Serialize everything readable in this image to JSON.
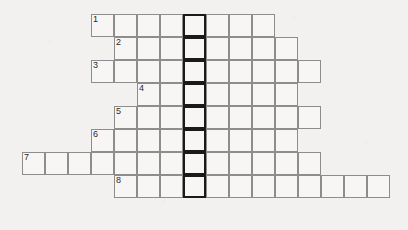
{
  "puzzle": {
    "kind": "crossword-grid",
    "title": "Crossword puzzle grid",
    "background_color": "#f2f1ef",
    "cell_fill_color": "#f7f6f4",
    "cell_border_color": "#8d8d8d",
    "highlight_border_color": "#1a1a1a",
    "number_text_color": "#2a2a2a",
    "cell_size_px": 23,
    "origin_x_px": 22,
    "origin_y_px": 14,
    "rows_count": 8,
    "columns_count": 16,
    "highlight_column_index": 7,
    "highlight_description": "bold outlined vertical column of 8 cells",
    "rows": [
      {
        "number": "1",
        "row_index": 0,
        "start_column": 3,
        "length": 8,
        "number_column": 3,
        "letters": [
          "",
          "",
          "",
          "",
          "",
          "",
          "",
          ""
        ]
      },
      {
        "number": "2",
        "row_index": 1,
        "start_column": 4,
        "length": 8,
        "number_column": 4,
        "letters": [
          "",
          "",
          "",
          "",
          "",
          "",
          "",
          ""
        ]
      },
      {
        "number": "3",
        "row_index": 2,
        "start_column": 3,
        "length": 10,
        "number_column": 3,
        "letters": [
          "",
          "",
          "",
          "",
          "",
          "",
          "",
          "",
          "",
          ""
        ]
      },
      {
        "number": "4",
        "row_index": 3,
        "start_column": 5,
        "length": 7,
        "number_column": 5,
        "letters": [
          "",
          "",
          "",
          "",
          "",
          "",
          ""
        ]
      },
      {
        "number": "5",
        "row_index": 4,
        "start_column": 4,
        "length": 9,
        "number_column": 4,
        "letters": [
          "",
          "",
          "",
          "",
          "",
          "",
          "",
          "",
          ""
        ]
      },
      {
        "number": "6",
        "row_index": 5,
        "start_column": 3,
        "length": 9,
        "number_column": 3,
        "letters": [
          "",
          "",
          "",
          "",
          "",
          "",
          "",
          "",
          ""
        ]
      },
      {
        "number": "7",
        "row_index": 6,
        "start_column": 0,
        "length": 13,
        "number_column": 0,
        "letters": [
          "",
          "",
          "",
          "",
          "",
          "",
          "",
          "",
          "",
          "",
          "",
          "",
          ""
        ]
      },
      {
        "number": "8",
        "row_index": 7,
        "start_column": 4,
        "length": 12,
        "number_column": 4,
        "letters": [
          "",
          "",
          "",
          "",
          "",
          "",
          "",
          "",
          "",
          "",
          "",
          ""
        ]
      }
    ]
  }
}
